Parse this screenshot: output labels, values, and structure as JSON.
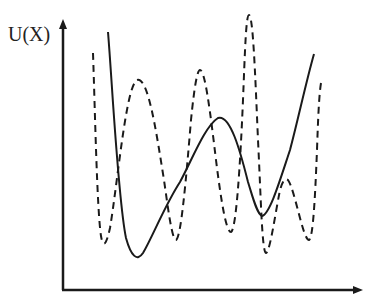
{
  "figure": {
    "ylabel": "U(X)",
    "xlabel": "",
    "colors": {
      "axis": "#1a1a1a",
      "solid": "#1a1a1a",
      "dashed": "#1a1a1a"
    },
    "axes": {
      "origin": [
        63,
        290
      ],
      "y_top": 22,
      "x_right": 362
    },
    "curves": {
      "solid": {
        "style": "solid",
        "path": "M108,32 C112,80 118,200 126,238 C131,256 137,262 143,253 C152,238 165,205 180,182 C192,160 205,126 218,118 C230,114 240,150 248,182 C253,198 257,214 262,216 C270,214 280,180 290,150 C298,120 306,82 314,54"
      },
      "dashed": {
        "style": "dashed",
        "path": "M93,53 C95,110 97,210 101,236 C103,248 106,246 110,228 C118,180 126,86 137,80 C148,76 156,130 164,180 C168,208 172,240 176,240 C181,238 186,180 191,120 C194,90 197,70 200,70 C205,70 210,110 216,160 C221,200 226,232 231,232 C236,230 240,170 243,100 C245,50 246,15 249,15 C253,16 255,70 258,140 C261,200 262,252 266,253 C270,252 275,215 280,190 C283,180 285,178 288,180 C295,190 303,240 309,240 C313,238 315,200 317,150 C318,120 319,95 321,83"
      }
    }
  }
}
